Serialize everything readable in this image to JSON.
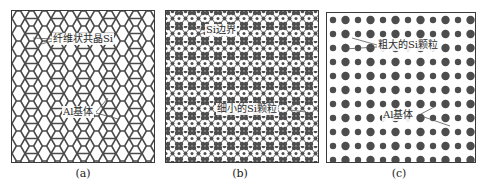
{
  "figure": {
    "panels": [
      {
        "id": "a",
        "caption": "(a)",
        "pattern": "hexagonal-network",
        "labels": [
          {
            "text": "纤维状共晶Si"
          },
          {
            "text": "Al基体"
          }
        ]
      },
      {
        "id": "b",
        "caption": "(b)",
        "pattern": "fine-particle-network",
        "labels": [
          {
            "text": "Si边界"
          },
          {
            "text": "细小的Si颗粒"
          }
        ]
      },
      {
        "id": "c",
        "caption": "(c)",
        "pattern": "coarse-particle-grid",
        "labels": [
          {
            "text": "粗大的Si颗粒"
          },
          {
            "text": "Al基体"
          }
        ]
      }
    ],
    "colors": {
      "line": "#4a4a4a",
      "particle": "#4d4d4d",
      "background": "#ffffff"
    }
  }
}
